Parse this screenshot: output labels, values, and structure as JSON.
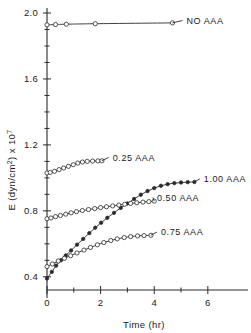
{
  "chart_data": {
    "type": "line",
    "title": "",
    "xlabel": "Time (hr)",
    "ylabel": "E (dyn/cm²) x 10⁷",
    "ylabel_parts": {
      "lead": "E (dyn/cm",
      "sup1": "2",
      "mid": ") x 10",
      "sup2": "7"
    },
    "xlim": [
      0,
      7.2
    ],
    "ylim": [
      0.32,
      2.0
    ],
    "grid": false,
    "legend_position": "inline-right",
    "x_ticks": [
      0,
      2,
      4,
      6
    ],
    "x_tick_labels": [
      "0",
      "2",
      "4",
      "6"
    ],
    "x_minor_ticks": [
      1,
      3,
      5
    ],
    "y_ticks": [
      0.4,
      0.8,
      1.2,
      1.6,
      2.0
    ],
    "y_tick_labels": [
      "0.4",
      "0.8",
      "1.2",
      "1.6",
      "2.0"
    ],
    "y_minor_ticks": [
      0.5,
      0.6,
      0.7,
      0.9,
      1.0,
      1.1,
      1.3,
      1.4,
      1.5,
      1.7,
      1.8,
      1.9
    ],
    "series": [
      {
        "name": "NO AAA",
        "label": "NO  AAA",
        "marker": "open-circle",
        "label_x": 5.2,
        "label_y": 1.935,
        "points": [
          {
            "x": 0.0,
            "y": 1.928
          },
          {
            "x": 0.32,
            "y": 1.93
          },
          {
            "x": 0.72,
            "y": 1.932
          },
          {
            "x": 1.8,
            "y": 1.935
          },
          {
            "x": 4.68,
            "y": 1.94
          }
        ]
      },
      {
        "name": "0.25 AAA",
        "label": "0.25  AAA",
        "marker": "open-circle",
        "label_x": 2.45,
        "label_y": 1.105,
        "points": [
          {
            "x": 0.0,
            "y": 1.03
          },
          {
            "x": 0.12,
            "y": 1.033
          },
          {
            "x": 0.28,
            "y": 1.04
          },
          {
            "x": 0.45,
            "y": 1.05
          },
          {
            "x": 0.62,
            "y": 1.06
          },
          {
            "x": 0.8,
            "y": 1.07
          },
          {
            "x": 0.98,
            "y": 1.08
          },
          {
            "x": 1.15,
            "y": 1.09
          },
          {
            "x": 1.32,
            "y": 1.096
          },
          {
            "x": 1.5,
            "y": 1.1
          },
          {
            "x": 1.7,
            "y": 1.102
          },
          {
            "x": 1.9,
            "y": 1.103
          },
          {
            "x": 2.05,
            "y": 1.104
          }
        ]
      },
      {
        "name": "1.00 AAA",
        "label": "1.00  AAA",
        "marker": "filled",
        "label_x": 5.85,
        "label_y": 0.975,
        "points": [
          {
            "x": 0.0,
            "y": 0.39
          },
          {
            "x": 0.18,
            "y": 0.43
          },
          {
            "x": 0.34,
            "y": 0.468
          },
          {
            "x": 0.52,
            "y": 0.5
          },
          {
            "x": 0.7,
            "y": 0.53
          },
          {
            "x": 0.9,
            "y": 0.56
          },
          {
            "x": 1.12,
            "y": 0.595
          },
          {
            "x": 1.35,
            "y": 0.63
          },
          {
            "x": 1.58,
            "y": 0.665
          },
          {
            "x": 1.8,
            "y": 0.698
          },
          {
            "x": 2.02,
            "y": 0.728
          },
          {
            "x": 2.25,
            "y": 0.758
          },
          {
            "x": 2.5,
            "y": 0.788
          },
          {
            "x": 2.75,
            "y": 0.818
          },
          {
            "x": 3.0,
            "y": 0.845
          },
          {
            "x": 3.25,
            "y": 0.872
          },
          {
            "x": 3.5,
            "y": 0.898
          },
          {
            "x": 3.75,
            "y": 0.92
          },
          {
            "x": 4.0,
            "y": 0.938
          },
          {
            "x": 4.25,
            "y": 0.952
          },
          {
            "x": 4.5,
            "y": 0.962
          },
          {
            "x": 4.75,
            "y": 0.968
          },
          {
            "x": 5.0,
            "y": 0.972
          },
          {
            "x": 5.25,
            "y": 0.974
          },
          {
            "x": 5.5,
            "y": 0.975
          }
        ]
      },
      {
        "name": "0.50 AAA",
        "label": "0.50  AAA",
        "marker": "open-circle",
        "label_x": 4.1,
        "label_y": 0.862,
        "points": [
          {
            "x": 0.0,
            "y": 0.752
          },
          {
            "x": 0.15,
            "y": 0.757
          },
          {
            "x": 0.32,
            "y": 0.765
          },
          {
            "x": 0.5,
            "y": 0.772
          },
          {
            "x": 0.7,
            "y": 0.78
          },
          {
            "x": 0.9,
            "y": 0.788
          },
          {
            "x": 1.1,
            "y": 0.795
          },
          {
            "x": 1.32,
            "y": 0.802
          },
          {
            "x": 1.55,
            "y": 0.808
          },
          {
            "x": 1.78,
            "y": 0.814
          },
          {
            "x": 2.0,
            "y": 0.82
          },
          {
            "x": 2.22,
            "y": 0.825
          },
          {
            "x": 2.45,
            "y": 0.83
          },
          {
            "x": 2.68,
            "y": 0.835
          },
          {
            "x": 2.9,
            "y": 0.84
          },
          {
            "x": 3.12,
            "y": 0.845
          },
          {
            "x": 3.35,
            "y": 0.849
          },
          {
            "x": 3.58,
            "y": 0.853
          },
          {
            "x": 3.8,
            "y": 0.856
          },
          {
            "x": 4.0,
            "y": 0.859
          }
        ]
      },
      {
        "name": "0.75 AAA",
        "label": "0.75  AAA",
        "marker": "open-circle",
        "label_x": 4.25,
        "label_y": 0.652,
        "points": [
          {
            "x": 0.0,
            "y": 0.462
          },
          {
            "x": 0.2,
            "y": 0.478
          },
          {
            "x": 0.42,
            "y": 0.496
          },
          {
            "x": 0.65,
            "y": 0.512
          },
          {
            "x": 0.88,
            "y": 0.528
          },
          {
            "x": 1.12,
            "y": 0.545
          },
          {
            "x": 1.38,
            "y": 0.562
          },
          {
            "x": 1.62,
            "y": 0.578
          },
          {
            "x": 1.88,
            "y": 0.594
          },
          {
            "x": 2.12,
            "y": 0.608
          },
          {
            "x": 2.38,
            "y": 0.62
          },
          {
            "x": 2.62,
            "y": 0.63
          },
          {
            "x": 2.88,
            "y": 0.638
          },
          {
            "x": 3.12,
            "y": 0.644
          },
          {
            "x": 3.38,
            "y": 0.648
          },
          {
            "x": 3.62,
            "y": 0.65
          },
          {
            "x": 3.88,
            "y": 0.652
          }
        ]
      }
    ]
  }
}
